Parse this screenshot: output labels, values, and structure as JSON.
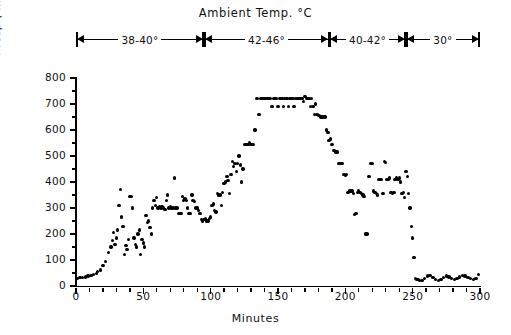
{
  "header": {
    "title": "Ambient  Temp. °C"
  },
  "temperature_segments": [
    {
      "label": "38-40°",
      "start_min": 0,
      "end_min": 95
    },
    {
      "label": "42-46°",
      "start_min": 95,
      "end_min": 188
    },
    {
      "label": "40-42°",
      "start_min": 188,
      "end_min": 245
    },
    {
      "label": "30°",
      "start_min": 245,
      "end_min": 300
    }
  ],
  "chart_data": {
    "type": "scatter",
    "title": "Ambient  Temp. °C",
    "xlabel": "Minutes",
    "ylabel": "f resp (min-1)",
    "ylabel_display": "f resp ( min",
    "ylabel_exponent": "-1",
    "ylabel_tail": ")",
    "xlim": [
      0,
      300
    ],
    "ylim": [
      0,
      800
    ],
    "x_ticks_major": [
      0,
      50,
      100,
      150,
      200,
      250,
      300
    ],
    "x_tick_labels": [
      "0",
      "50",
      "100",
      "150",
      "200",
      "250",
      "300"
    ],
    "x_tick_minor_step": 10,
    "y_ticks_major": [
      0,
      100,
      200,
      300,
      400,
      500,
      600,
      700,
      800
    ],
    "y_tick_labels": [
      "0",
      "100",
      "200",
      "300",
      "400",
      "500",
      "600",
      "700",
      "800"
    ],
    "y_tick_minor_step": 50,
    "grid": false,
    "legend": false,
    "marker": "filled-circle",
    "marker_color": "#000000",
    "series": [
      {
        "name": "respiratory frequency",
        "points": [
          [
            1,
            30
          ],
          [
            3,
            32
          ],
          [
            5,
            33
          ],
          [
            7,
            35
          ],
          [
            9,
            38
          ],
          [
            11,
            40
          ],
          [
            13,
            45
          ],
          [
            15,
            48
          ],
          [
            16,
            55
          ],
          [
            18,
            62
          ],
          [
            20,
            80
          ],
          [
            22,
            95
          ],
          [
            24,
            130
          ],
          [
            26,
            150
          ],
          [
            27,
            175
          ],
          [
            28,
            205
          ],
          [
            29,
            160
          ],
          [
            30,
            185
          ],
          [
            31,
            215
          ],
          [
            32,
            310
          ],
          [
            33,
            370
          ],
          [
            34,
            265
          ],
          [
            35,
            230
          ],
          [
            36,
            120
          ],
          [
            37,
            155
          ],
          [
            38,
            140
          ],
          [
            39,
            180
          ],
          [
            40,
            345
          ],
          [
            41,
            345
          ],
          [
            42,
            300
          ],
          [
            43,
            185
          ],
          [
            44,
            160
          ],
          [
            45,
            150
          ],
          [
            46,
            200
          ],
          [
            47,
            215
          ],
          [
            48,
            120
          ],
          [
            49,
            180
          ],
          [
            50,
            165
          ],
          [
            51,
            150
          ],
          [
            52,
            270
          ],
          [
            53,
            245
          ],
          [
            54,
            250
          ],
          [
            55,
            225
          ],
          [
            56,
            200
          ],
          [
            57,
            300
          ],
          [
            58,
            330
          ],
          [
            59,
            310
          ],
          [
            60,
            340
          ],
          [
            61,
            300
          ],
          [
            62,
            305
          ],
          [
            63,
            300
          ],
          [
            64,
            305
          ],
          [
            65,
            300
          ],
          [
            66,
            295
          ],
          [
            67,
            330
          ],
          [
            68,
            350
          ],
          [
            69,
            300
          ],
          [
            70,
            305
          ],
          [
            71,
            300
          ],
          [
            72,
            300
          ],
          [
            73,
            415
          ],
          [
            74,
            300
          ],
          [
            75,
            300
          ],
          [
            76,
            280
          ],
          [
            77,
            280
          ],
          [
            78,
            280
          ],
          [
            79,
            345
          ],
          [
            80,
            330
          ],
          [
            81,
            335
          ],
          [
            82,
            330
          ],
          [
            83,
            300
          ],
          [
            84,
            280
          ],
          [
            85,
            280
          ],
          [
            86,
            350
          ],
          [
            87,
            330
          ],
          [
            88,
            325
          ],
          [
            89,
            300
          ],
          [
            90,
            300
          ],
          [
            91,
            290
          ],
          [
            92,
            280
          ],
          [
            93,
            255
          ],
          [
            94,
            250
          ],
          [
            95,
            255
          ],
          [
            96,
            260
          ],
          [
            97,
            250
          ],
          [
            98,
            250
          ],
          [
            99,
            260
          ],
          [
            100,
            265
          ],
          [
            101,
            310
          ],
          [
            102,
            315
          ],
          [
            103,
            290
          ],
          [
            104,
            285
          ],
          [
            105,
            355
          ],
          [
            106,
            350
          ],
          [
            107,
            350
          ],
          [
            108,
            310
          ],
          [
            109,
            360
          ],
          [
            110,
            395
          ],
          [
            111,
            400
          ],
          [
            112,
            420
          ],
          [
            113,
            405
          ],
          [
            114,
            355
          ],
          [
            115,
            430
          ],
          [
            116,
            480
          ],
          [
            117,
            460
          ],
          [
            118,
            470
          ],
          [
            119,
            440
          ],
          [
            120,
            470
          ],
          [
            121,
            500
          ],
          [
            122,
            465
          ],
          [
            123,
            400
          ],
          [
            124,
            450
          ],
          [
            125,
            545
          ],
          [
            126,
            545
          ],
          [
            127,
            545
          ],
          [
            128,
            545
          ],
          [
            129,
            550
          ],
          [
            130,
            545
          ],
          [
            131,
            545
          ],
          [
            132,
            545
          ],
          [
            133,
            600
          ],
          [
            134,
            720
          ],
          [
            135,
            720
          ],
          [
            136,
            660
          ],
          [
            137,
            720
          ],
          [
            138,
            720
          ],
          [
            139,
            720
          ],
          [
            140,
            720
          ],
          [
            141,
            720
          ],
          [
            142,
            720
          ],
          [
            143,
            720
          ],
          [
            144,
            720
          ],
          [
            145,
            690
          ],
          [
            146,
            690
          ],
          [
            147,
            720
          ],
          [
            148,
            720
          ],
          [
            149,
            720
          ],
          [
            150,
            690
          ],
          [
            151,
            720
          ],
          [
            152,
            720
          ],
          [
            153,
            720
          ],
          [
            154,
            690
          ],
          [
            155,
            720
          ],
          [
            156,
            720
          ],
          [
            157,
            720
          ],
          [
            158,
            690
          ],
          [
            159,
            720
          ],
          [
            160,
            720
          ],
          [
            161,
            720
          ],
          [
            162,
            690
          ],
          [
            163,
            720
          ],
          [
            164,
            720
          ],
          [
            165,
            720
          ],
          [
            166,
            720
          ],
          [
            167,
            720
          ],
          [
            168,
            720
          ],
          [
            169,
            710
          ],
          [
            170,
            730
          ],
          [
            171,
            720
          ],
          [
            172,
            720
          ],
          [
            173,
            720
          ],
          [
            174,
            690
          ],
          [
            175,
            720
          ],
          [
            176,
            690
          ],
          [
            177,
            660
          ],
          [
            178,
            700
          ],
          [
            179,
            660
          ],
          [
            180,
            655
          ],
          [
            181,
            655
          ],
          [
            182,
            650
          ],
          [
            183,
            650
          ],
          [
            184,
            650
          ],
          [
            185,
            650
          ],
          [
            186,
            600
          ],
          [
            187,
            590
          ],
          [
            188,
            560
          ],
          [
            189,
            565
          ],
          [
            190,
            545
          ],
          [
            191,
            520
          ],
          [
            192,
            520
          ],
          [
            193,
            515
          ],
          [
            194,
            515
          ],
          [
            195,
            470
          ],
          [
            196,
            470
          ],
          [
            197,
            470
          ],
          [
            198,
            470
          ],
          [
            199,
            430
          ],
          [
            200,
            425
          ],
          [
            201,
            430
          ],
          [
            202,
            360
          ],
          [
            203,
            365
          ],
          [
            204,
            365
          ],
          [
            205,
            365
          ],
          [
            206,
            355
          ],
          [
            207,
            275
          ],
          [
            208,
            280
          ],
          [
            209,
            360
          ],
          [
            210,
            365
          ],
          [
            211,
            360
          ],
          [
            212,
            355
          ],
          [
            213,
            350
          ],
          [
            214,
            345
          ],
          [
            215,
            200
          ],
          [
            216,
            200
          ],
          [
            217,
            420
          ],
          [
            218,
            420
          ],
          [
            219,
            470
          ],
          [
            220,
            470
          ],
          [
            221,
            365
          ],
          [
            222,
            360
          ],
          [
            223,
            355
          ],
          [
            224,
            350
          ],
          [
            225,
            410
          ],
          [
            226,
            410
          ],
          [
            227,
            410
          ],
          [
            228,
            355
          ],
          [
            229,
            480
          ],
          [
            230,
            475
          ],
          [
            231,
            410
          ],
          [
            232,
            410
          ],
          [
            233,
            415
          ],
          [
            234,
            360
          ],
          [
            235,
            355
          ],
          [
            236,
            360
          ],
          [
            237,
            410
          ],
          [
            238,
            415
          ],
          [
            239,
            410
          ],
          [
            240,
            415
          ],
          [
            241,
            400
          ],
          [
            242,
            355
          ],
          [
            243,
            360
          ],
          [
            244,
            340
          ],
          [
            245,
            440
          ],
          [
            246,
            420
          ],
          [
            247,
            355
          ],
          [
            248,
            300
          ],
          [
            249,
            230
          ],
          [
            250,
            185
          ],
          [
            251,
            110
          ],
          [
            252,
            30
          ],
          [
            253,
            25
          ],
          [
            254,
            25
          ],
          [
            255,
            22
          ],
          [
            257,
            22
          ],
          [
            259,
            30
          ],
          [
            261,
            38
          ],
          [
            263,
            40
          ],
          [
            265,
            32
          ],
          [
            267,
            25
          ],
          [
            269,
            22
          ],
          [
            271,
            25
          ],
          [
            273,
            32
          ],
          [
            275,
            38
          ],
          [
            277,
            35
          ],
          [
            279,
            28
          ],
          [
            281,
            25
          ],
          [
            283,
            28
          ],
          [
            285,
            35
          ],
          [
            287,
            40
          ],
          [
            289,
            38
          ],
          [
            291,
            32
          ],
          [
            293,
            28
          ],
          [
            295,
            26
          ],
          [
            297,
            30
          ],
          [
            299,
            45
          ]
        ]
      }
    ]
  }
}
